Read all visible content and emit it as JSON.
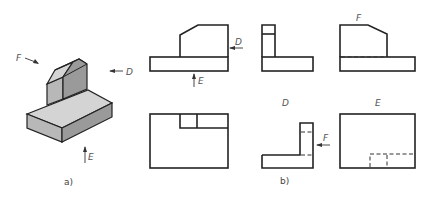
{
  "figure": {
    "part_a": {
      "caption": "a)",
      "direction_labels": {
        "F": "F",
        "D": "D",
        "E": "E"
      },
      "colors": {
        "top_face": "#d4d4d4",
        "side_face": "#9a9a9a",
        "front_face": "#b8b8b8",
        "outline": "#222222"
      }
    },
    "part_b": {
      "caption": "b)",
      "views": [
        {
          "name": "front-view",
          "arrow_labels": [
            "D",
            "E"
          ]
        },
        {
          "name": "side-view-D",
          "label": ""
        },
        {
          "name": "view-F",
          "label": "F"
        },
        {
          "name": "top-view",
          "label": ""
        },
        {
          "name": "view-D",
          "label": "D",
          "arrow_labels": [
            "F"
          ]
        },
        {
          "name": "view-E",
          "label": "E"
        }
      ]
    }
  }
}
